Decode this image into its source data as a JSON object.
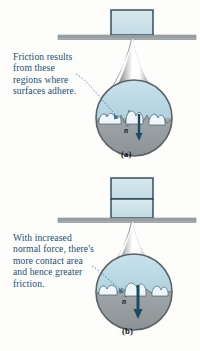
{
  "figure": {
    "background_color": "#fdfdfc"
  },
  "colors": {
    "caption_text": "#1f4e6b",
    "block_fill": "#cfe2ea",
    "block_stroke": "#2d4350",
    "surface_fill": "#9aa2a5",
    "surface_stroke": "#6c7477",
    "magnifier_gray": "#8d9396",
    "circle_upper_fill": "#bcd9e4",
    "circle_lower_fill": "#9a9fa1",
    "asperity_fill": "#eef5f8",
    "arrow_color": "#1d4a63",
    "leader_line": "#3f6f8e"
  },
  "panels": [
    {
      "id": "a",
      "label": "(a)",
      "caption_lines": [
        "Friction results",
        "from these",
        "regions where",
        "surfaces adhere."
      ],
      "normal_force_symbol": "n",
      "block_count": 1,
      "block_labels": [
        "block"
      ],
      "magnified_view": "small contact regions where surfaces adhere"
    },
    {
      "id": "b",
      "label": "(b)",
      "caption_lines": [
        "With increased",
        "normal force, there's",
        "more contact area",
        "and hence greater",
        "friction."
      ],
      "normal_force_symbol": "n",
      "block_count": 2,
      "block_labels": [
        "upper block",
        "lower block"
      ],
      "magnified_view": "larger flattened contact regions"
    }
  ]
}
